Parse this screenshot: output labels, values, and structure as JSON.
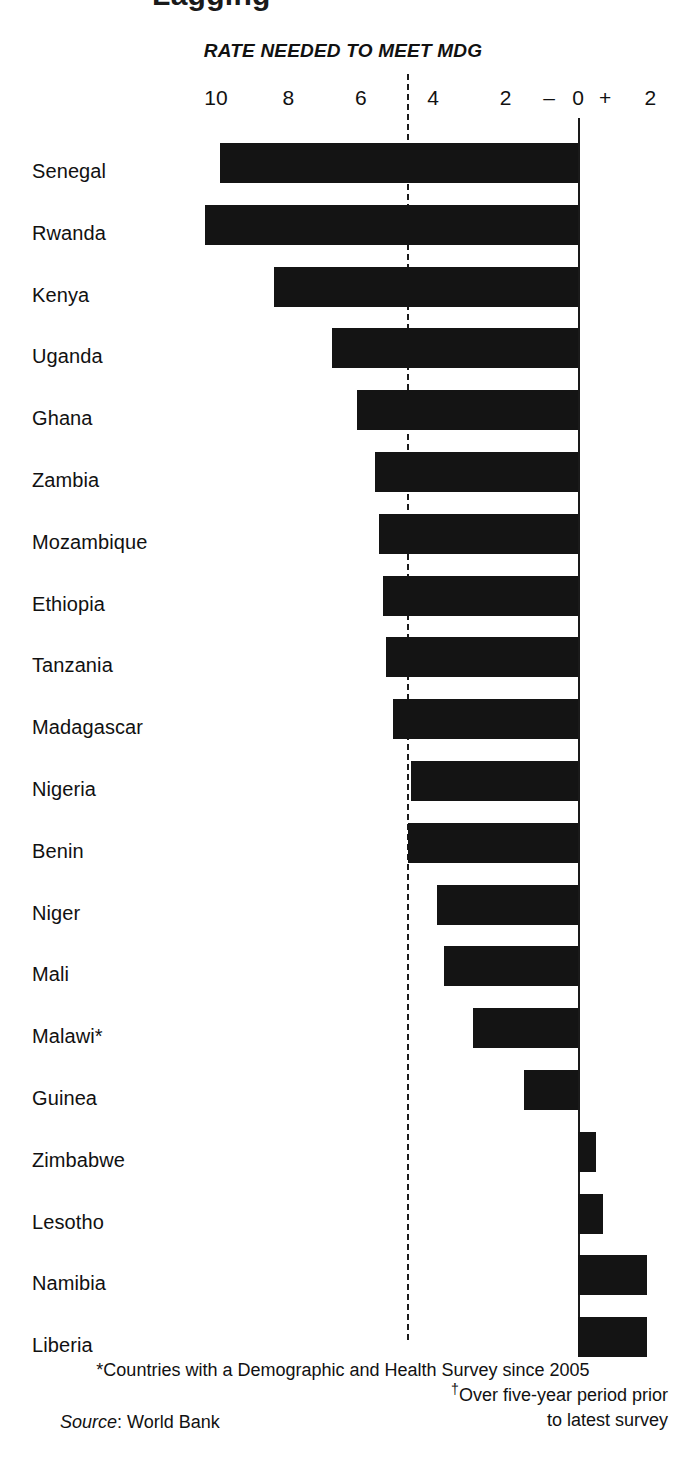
{
  "title_fragment": "Lagging",
  "axis_header": "RATE NEEDED TO MEET MDG",
  "axis": {
    "ticks": [
      {
        "label": "10",
        "value": 10
      },
      {
        "label": "8",
        "value": 8
      },
      {
        "label": "6",
        "value": 6
      },
      {
        "label": "4",
        "value": 4
      },
      {
        "label": "2",
        "value": 2
      },
      {
        "label": "–",
        "value": 0.8
      },
      {
        "label": "0",
        "value": 0
      },
      {
        "label": "+",
        "value": -0.75
      },
      {
        "label": "2",
        "value": -2
      }
    ],
    "mdg_threshold": 4.7,
    "zero_line_value": 0,
    "negative_sign_label": "–",
    "positive_sign_label": "+"
  },
  "footnotes": {
    "star": "*Countries with a Demographic and Health Survey since 2005",
    "dagger_line1": "Over five-year period prior",
    "dagger_line2": "to latest survey",
    "dagger_marker": "†",
    "source_label": "Source",
    "source_sep": ": ",
    "source_value": "World Bank"
  },
  "chart_data": {
    "type": "bar",
    "orientation": "horizontal",
    "title": "RATE NEEDED TO MEET MDG",
    "xlabel": "Annual rate of change in under-five mortality, %",
    "ylabel": "",
    "xlim": [
      10.8,
      -2.6
    ],
    "axis_reversed": true,
    "grid": false,
    "legend": null,
    "annotations": [
      {
        "text": "RATE NEEDED TO MEET MDG",
        "kind": "axis-header"
      },
      {
        "text": "dashed line at 4.7 = rate needed to meet MDG",
        "kind": "reference-line",
        "value": 4.7
      }
    ],
    "note": "Bars left of the 0 line are reductions (progress); bars right of 0 are increases. Values read from bar extents.",
    "categories": [
      "Senegal",
      "Rwanda",
      "Kenya",
      "Uganda",
      "Ghana",
      "Zambia",
      "Mozambique",
      "Ethiopia",
      "Tanzania",
      "Madagascar",
      "Nigeria",
      "Benin",
      "Niger",
      "Mali",
      "Malawi*",
      "Guinea",
      "Zimbabwe",
      "Lesotho",
      "Namibia",
      "Liberia"
    ],
    "values": [
      9.9,
      10.3,
      8.4,
      6.8,
      6.1,
      5.6,
      5.5,
      5.4,
      5.3,
      5.1,
      4.6,
      4.7,
      3.9,
      3.7,
      2.9,
      1.5,
      -0.5,
      -0.7,
      -1.9,
      -1.9
    ],
    "bars": [
      {
        "label": "Senegal",
        "value": 9.9,
        "direction": "reduction"
      },
      {
        "label": "Rwanda",
        "value": 10.3,
        "direction": "reduction"
      },
      {
        "label": "Kenya",
        "value": 8.4,
        "direction": "reduction"
      },
      {
        "label": "Uganda",
        "value": 6.8,
        "direction": "reduction"
      },
      {
        "label": "Ghana",
        "value": 6.1,
        "direction": "reduction"
      },
      {
        "label": "Zambia",
        "value": 5.6,
        "direction": "reduction"
      },
      {
        "label": "Mozambique",
        "value": 5.5,
        "direction": "reduction"
      },
      {
        "label": "Ethiopia",
        "value": 5.4,
        "direction": "reduction"
      },
      {
        "label": "Tanzania",
        "value": 5.3,
        "direction": "reduction"
      },
      {
        "label": "Madagascar",
        "value": 5.1,
        "direction": "reduction"
      },
      {
        "label": "Nigeria",
        "value": 4.6,
        "direction": "reduction"
      },
      {
        "label": "Benin",
        "value": 4.7,
        "direction": "reduction"
      },
      {
        "label": "Niger",
        "value": 3.9,
        "direction": "reduction"
      },
      {
        "label": "Mali",
        "value": 3.7,
        "direction": "reduction"
      },
      {
        "label": "Malawi*",
        "value": 2.9,
        "direction": "reduction"
      },
      {
        "label": "Guinea",
        "value": 1.5,
        "direction": "reduction"
      },
      {
        "label": "Zimbabwe",
        "value": -0.5,
        "direction": "increase"
      },
      {
        "label": "Lesotho",
        "value": -0.7,
        "direction": "increase"
      },
      {
        "label": "Namibia",
        "value": -1.9,
        "direction": "increase"
      },
      {
        "label": "Liberia",
        "value": -1.9,
        "direction": "increase"
      }
    ],
    "bar_color": "#141414"
  }
}
